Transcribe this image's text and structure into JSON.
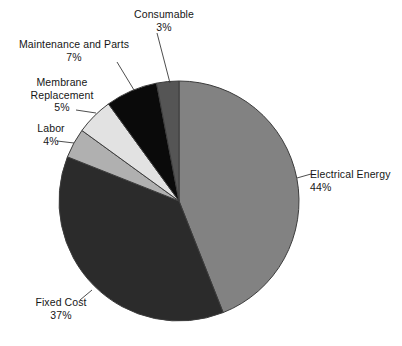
{
  "chart_data": {
    "type": "pie",
    "title": "",
    "subtitle": "",
    "xlabel": "",
    "ylabel": "",
    "legend_position": "none",
    "labels_style": "outside-with-leader-lines",
    "start_angle_deg": 0,
    "direction": "clockwise",
    "categories": [
      "Electrical Energy",
      "Fixed Cost",
      "Labor",
      "Membrane Replacement",
      "Maintenance and Parts",
      "Consumable"
    ],
    "values": [
      44,
      37,
      4,
      5,
      7,
      3
    ],
    "value_unit": "%",
    "total": 100,
    "slices": [
      {
        "name": "Electrical Energy",
        "label": "Electrical Energy",
        "value": 44,
        "percent_text": "44%",
        "color": "#828282",
        "start_deg": 0,
        "end_deg": 158.4
      },
      {
        "name": "Fixed Cost",
        "label": "Fixed Cost",
        "value": 37,
        "percent_text": "37%",
        "color": "#2b2b2b",
        "start_deg": 158.4,
        "end_deg": 291.6
      },
      {
        "name": "Labor",
        "label": "Labor",
        "value": 4,
        "percent_text": "4%",
        "color": "#b0b0b0",
        "start_deg": 291.6,
        "end_deg": 306.0
      },
      {
        "name": "Membrane Replacement",
        "label": "Membrane\nReplacement",
        "label_line1": "Membrane",
        "label_line2": "Replacement",
        "value": 5,
        "percent_text": "5%",
        "color": "#e2e2e2",
        "start_deg": 306.0,
        "end_deg": 324.0
      },
      {
        "name": "Maintenance and Parts",
        "label": "Maintenance and Parts",
        "value": 7,
        "percent_text": "7%",
        "color": "#0a0a0a",
        "start_deg": 324.0,
        "end_deg": 349.2
      },
      {
        "name": "Consumable",
        "label": "Consumable",
        "value": 3,
        "percent_text": "3%",
        "color": "#555555",
        "start_deg": 349.2,
        "end_deg": 360.0
      }
    ]
  },
  "labels": {
    "consumable": {
      "name": "Consumable",
      "percent": "3%"
    },
    "maintenance": {
      "name": "Maintenance and Parts",
      "percent": "7%"
    },
    "membrane": {
      "line1": "Membrane",
      "line2": "Replacement",
      "percent": "5%"
    },
    "labor": {
      "name": "Labor",
      "percent": "4%"
    },
    "electrical": {
      "name": "Electrical Energy",
      "percent": "44%"
    },
    "fixed_cost": {
      "name": "Fixed Cost",
      "percent": "37%"
    }
  },
  "caption": {
    "partial_text": ""
  },
  "colors": {
    "background": "#ffffff",
    "text": "#161616",
    "leader_line": "#3a3a3a",
    "pie_outline": "#3c3c3c"
  }
}
